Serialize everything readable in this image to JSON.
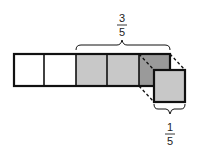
{
  "diagram": {
    "type": "fraction-strip",
    "total_parts": 5,
    "cells": [
      {
        "index": 1,
        "shaded": false,
        "fill": "#ffffff"
      },
      {
        "index": 2,
        "shaded": false,
        "fill": "#ffffff"
      },
      {
        "index": 3,
        "shaded": true,
        "fill": "#c8c8c8"
      },
      {
        "index": 4,
        "shaded": true,
        "fill": "#c8c8c8"
      },
      {
        "index": 5,
        "shaded": true,
        "fill": "#9a9a9a",
        "note": "removed part, shown pulled out"
      }
    ],
    "top_label": {
      "numerator": "3",
      "denominator": "5"
    },
    "bottom_label": {
      "numerator": "1",
      "denominator": "5"
    },
    "colors": {
      "outline": "#111111",
      "shade_light": "#c8c8c8",
      "shade_dark": "#9a9a9a"
    }
  }
}
